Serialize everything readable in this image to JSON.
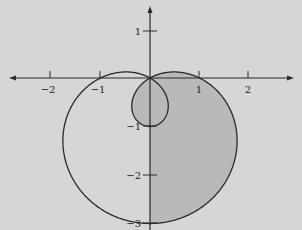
{
  "chart_data": {
    "type": "line",
    "title": "",
    "subtitle": "",
    "xlabel": "",
    "ylabel": "",
    "equation": "r = 1 - 2 sin(theta)",
    "curve_type": "polar limacon with inner loop",
    "xlim": [
      -2.9,
      2.9
    ],
    "ylim": [
      -3.05,
      1.45
    ],
    "grid": false,
    "legend": null,
    "x_ticks": [
      {
        "value": -2,
        "label": "−2"
      },
      {
        "value": -1,
        "label": "−1"
      },
      {
        "value": 1,
        "label": "1"
      },
      {
        "value": 2,
        "label": "2"
      }
    ],
    "y_ticks": [
      {
        "value": 1,
        "label": "1"
      },
      {
        "value": -1,
        "label": "−1"
      },
      {
        "value": -2,
        "label": "−2"
      },
      {
        "value": -3,
        "label": "−3"
      }
    ],
    "key_points": [
      {
        "x": 0,
        "y": 0,
        "note": "pole / self-intersection"
      },
      {
        "x": -1,
        "y": 0,
        "note": "curve crosses negative x-axis"
      },
      {
        "x": 1,
        "y": 0,
        "note": "curve crosses positive x-axis"
      },
      {
        "x": 0,
        "y": -1,
        "note": "bottom of inner loop"
      },
      {
        "x": 0,
        "y": -3,
        "note": "bottom of outer loop"
      }
    ],
    "shaded_region": "area between outer and inner loop for x >= 0",
    "colors": {
      "background": "#d6d6d6",
      "curve": "#2a2a2a",
      "axes": "#2a2a2a",
      "shade": "#b9b9b9"
    }
  },
  "axes": {
    "x_tick_labels": [
      "−2",
      "−1",
      "1",
      "2"
    ],
    "y_tick_labels": [
      "1",
      "−1",
      "−2",
      "−3"
    ]
  }
}
